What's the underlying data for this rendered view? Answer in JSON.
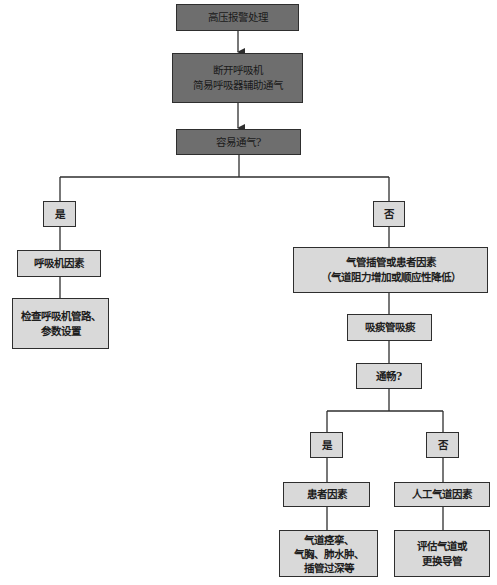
{
  "flowchart": {
    "title_node": "高压报警处理",
    "step_disconnect": "断开呼吸机\n简易呼吸器辅助通气",
    "decision_easy_ventilation": "容易通气?",
    "branch_left": {
      "label": "是",
      "factor": "呼吸机因素",
      "action": "检查呼吸机管路、\n参数设置"
    },
    "branch_right": {
      "label": "否",
      "factor": "气管插管或患者因素\n（气道阻力增加或顺应性降低）",
      "action": "吸痰管吸痰",
      "decision_patent": "通畅?",
      "sub_left": {
        "label": "是",
        "factor": "患者因素",
        "action": "气道痉挛、\n气胸、肺水肿、\n插管过深等"
      },
      "sub_right": {
        "label": "否",
        "factor": "人工气道因素",
        "action": "评估气道或\n更换导管"
      }
    }
  },
  "colors": {
    "dark_box": "#6e6e6e",
    "light_box": "#d9d9d9",
    "line": "#2e2e2e"
  }
}
